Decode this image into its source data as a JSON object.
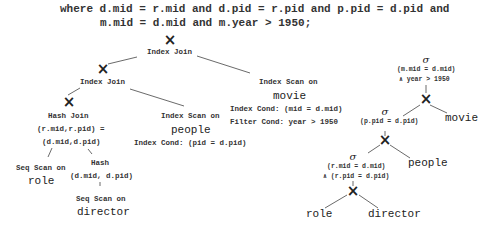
{
  "sql": {
    "line1": "where d.mid = r.mid and d.pid = r.pid and p.pid = d.pid and",
    "line2": "m.mid = d.mid and m.year > 1950;"
  },
  "physical_plan": {
    "root": {
      "symbol": "×",
      "label": "Index Join"
    },
    "left_join": {
      "symbol": "×",
      "label": "Index Join"
    },
    "hash_join": {
      "symbol": "×",
      "label": "Hash Join",
      "cond1": "(r.mid,r.pid) =",
      "cond2": "(d.mid,d.pid)"
    },
    "seq_scan_role": {
      "label": "Seq Scan on",
      "table": "role"
    },
    "hash": {
      "label": "Hash",
      "keys": "(d.mid, d.pid)"
    },
    "seq_scan_director": {
      "label": "Seq Scan on",
      "table": "director"
    },
    "index_scan_people": {
      "label": "Index Scan on",
      "table": "people",
      "index_cond": "Index Cond:  (pid = d.pid)"
    },
    "index_scan_movie": {
      "label": "Index Scan on",
      "table": "movie",
      "index_cond": "Index Cond:  (mid = d.mid)",
      "filter_cond": "Filter Cond:  year > 1950"
    }
  },
  "logical_plan": {
    "top_select": {
      "symbol": "σ",
      "cond1": "(m.mid = d.mid)",
      "cond2": "∧ year > 1950"
    },
    "top_join": {
      "symbol": "×"
    },
    "movie": "movie",
    "mid_select": {
      "symbol": "σ",
      "cond1": "(p.pid = d.pid)"
    },
    "mid_join": {
      "symbol": "×"
    },
    "people": "people",
    "low_select": {
      "symbol": "σ",
      "cond1": "(r.mid = d.mid)",
      "cond2": "∧ (r.pid = d.pid)"
    },
    "low_join": {
      "symbol": "×"
    },
    "role": "role",
    "director": "director"
  }
}
